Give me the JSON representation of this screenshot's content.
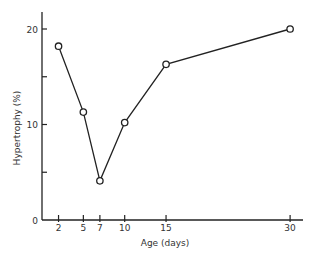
{
  "chart_data": {
    "type": "line",
    "title": "",
    "xlabel": "Age (days)",
    "ylabel": "Hypertrophy (%)",
    "x": [
      2,
      5,
      7,
      10,
      15,
      30
    ],
    "series": [
      {
        "name": "Hypertrophy",
        "values": [
          18.2,
          11.3,
          4.1,
          10.2,
          16.3,
          20.0
        ],
        "marker": "open-circle",
        "color": "#222222"
      }
    ],
    "xticks": [
      2,
      5,
      7,
      10,
      15,
      30
    ],
    "xtick_labels": [
      "2",
      "5",
      "7",
      "10",
      "15",
      "30"
    ],
    "yticks": [
      0,
      5,
      10,
      15,
      20
    ],
    "ytick_labels": [
      "0",
      "",
      "10",
      "",
      "20"
    ],
    "xlim": [
      0,
      32
    ],
    "ylim": [
      0,
      22
    ],
    "grid": false,
    "legend": null
  },
  "axes": {
    "xlabel": "Age (days)",
    "ylabel": "Hypertrophy (%)"
  }
}
